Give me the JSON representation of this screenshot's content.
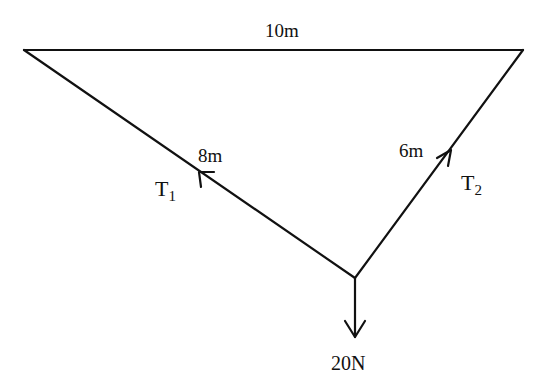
{
  "diagram": {
    "type": "force diagram - suspended weight",
    "top_length_label": "10m",
    "left_length_label": "8m",
    "right_length_label": "6m",
    "left_tension": {
      "main": "T",
      "sub": "1"
    },
    "right_tension": {
      "main": "T",
      "sub": "2"
    },
    "weight_label": "20N",
    "colors": {
      "line": "#111111",
      "background": "#ffffff"
    }
  }
}
